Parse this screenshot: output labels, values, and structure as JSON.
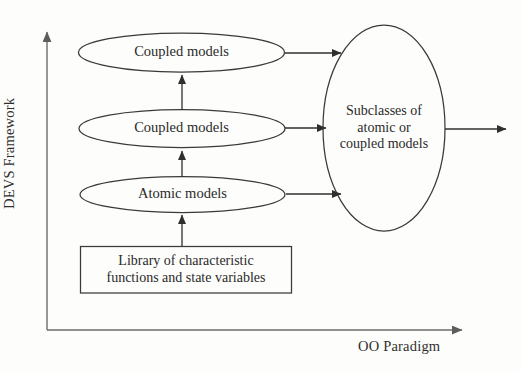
{
  "figure": {
    "axes": {
      "y_label": "DEVS Framework",
      "x_label": "OO Paradigm",
      "line_color": "#6b6b6b"
    },
    "nodes": {
      "top_ellipse": {
        "label": "Coupled models",
        "shape": "ellipse"
      },
      "middle_ellipse": {
        "label": "Coupled models",
        "shape": "ellipse"
      },
      "bottom_ellipse": {
        "label": "Atomic models",
        "shape": "ellipse"
      },
      "library_box": {
        "label": "Library of characteristic\nfunctions and state variables",
        "shape": "rectangle"
      },
      "subclasses_ellipse": {
        "label": "Subclasses of\natomic or\ncoupled models",
        "shape": "ellipse"
      }
    },
    "edges": [
      {
        "name": "library-to-atomic",
        "from": "library_box",
        "to": "bottom_ellipse",
        "direction": "up"
      },
      {
        "name": "atomic-to-coupled-middle",
        "from": "bottom_ellipse",
        "to": "middle_ellipse",
        "direction": "up"
      },
      {
        "name": "coupled-middle-to-coupled-top",
        "from": "middle_ellipse",
        "to": "top_ellipse",
        "direction": "up"
      },
      {
        "name": "coupled-top-to-subclasses",
        "from": "top_ellipse",
        "to": "subclasses_ellipse",
        "direction": "right"
      },
      {
        "name": "coupled-middle-to-subclasses",
        "from": "middle_ellipse",
        "to": "subclasses_ellipse",
        "direction": "right"
      },
      {
        "name": "atomic-to-subclasses",
        "from": "bottom_ellipse",
        "to": "subclasses_ellipse",
        "direction": "right"
      },
      {
        "name": "subclasses-output",
        "from": "subclasses_ellipse",
        "to": "",
        "direction": "right"
      }
    ],
    "stroke_color": "#3a3a3a"
  }
}
